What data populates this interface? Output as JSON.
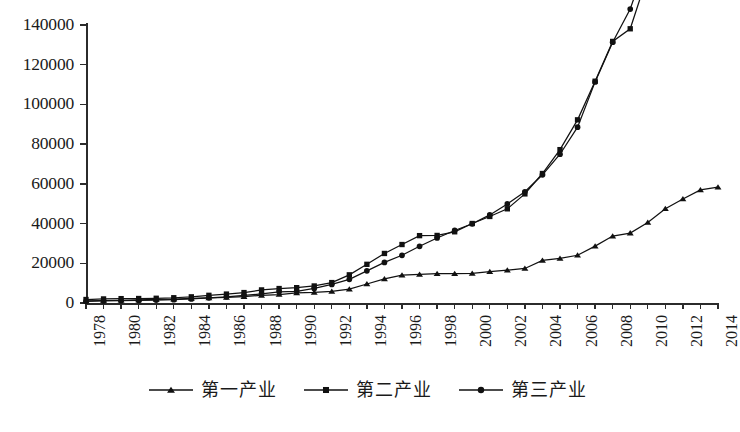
{
  "chart_data": {
    "type": "line",
    "title": "",
    "subtitle": "",
    "xlabel": "",
    "ylabel": "",
    "grid": false,
    "legend_position": "bottom",
    "ylim": [
      0,
      140000
    ],
    "ytick_step": 20000,
    "y_ticks": [
      "0",
      "20000",
      "40000",
      "60000",
      "80000",
      "100000",
      "120000",
      "140000"
    ],
    "xlim": [
      1978,
      2014
    ],
    "x_tick_step": 1,
    "x_label_step": 2,
    "x": [
      1978,
      1979,
      1980,
      1981,
      1982,
      1983,
      1984,
      1985,
      1986,
      1987,
      1988,
      1989,
      1990,
      1991,
      1992,
      1993,
      1994,
      1995,
      1996,
      1997,
      1998,
      1999,
      2000,
      2001,
      2002,
      2003,
      2004,
      2005,
      2006,
      2007,
      2008,
      2009,
      2010,
      2011,
      2012,
      2013,
      2014
    ],
    "x_tick_labels": [
      "1978",
      "1980",
      "1982",
      "1984",
      "1986",
      "1988",
      "1990",
      "1992",
      "1994",
      "1996",
      "1998",
      "2000",
      "2002",
      "2004",
      "2006",
      "2008",
      "2010",
      "2012",
      "2014"
    ],
    "series": [
      {
        "name": "第一产业",
        "marker": "triangle",
        "color": "#111111",
        "values": [
          1018,
          1258,
          1371,
          1559,
          1777,
          1978,
          2316,
          2564,
          2788,
          3233,
          3865,
          4265,
          5062,
          5342,
          5866,
          6963,
          9572,
          12135,
          14015,
          14441,
          14817,
          14770,
          14944,
          15781,
          16537,
          17381,
          21412,
          22420,
          24040,
          28627,
          33702,
          35226,
          40533,
          47486,
          52377,
          56957,
          58332
        ]
      },
      {
        "name": "第二产业",
        "marker": "square",
        "color": "#111111",
        "values": [
          1755,
          2048,
          2193,
          2256,
          2383,
          2646,
          3106,
          3867,
          4493,
          5252,
          6587,
          7278,
          7717,
          8580,
          10284,
          14188,
          19480,
          24950,
          29448,
          33921,
          34018,
          35861,
          40034,
          43581,
          47431,
          54946,
          65210,
          77231,
          92238,
          111693,
          131728,
          138096,
          165126,
          195142,
          208906,
          222337,
          233856
        ]
      },
      {
        "name": "第三产业",
        "marker": "circle",
        "color": "#111111",
        "values": [
          872,
          1022,
          1135,
          1283,
          1453,
          1682,
          2017,
          2586,
          3114,
          3783,
          4644,
          5642,
          5888,
          7337,
          9357,
          11916,
          16180,
          20428,
          24033,
          28548,
          32753,
          36530,
          39898,
          44362,
          49899,
          56005,
          64561,
          74920,
          88555,
          111352,
          131340,
          148038,
          173596,
          208906,
          238676,
          262204,
          306739
        ]
      }
    ]
  },
  "legend": {
    "items": [
      {
        "label": "第一产业",
        "marker": "triangle"
      },
      {
        "label": "第二产业",
        "marker": "square"
      },
      {
        "label": "第三产业",
        "marker": "circle"
      }
    ]
  }
}
